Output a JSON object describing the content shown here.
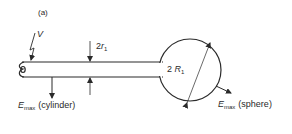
{
  "figure": {
    "panel_label": "(a)",
    "voltage_label": "V",
    "wire_diameter_label": {
      "prefix": "2",
      "var": "r",
      "sub": "1"
    },
    "sphere_diameter_label": {
      "prefix": "2 ",
      "var": "R",
      "sub": "1"
    },
    "emax_cylinder": {
      "var": "E",
      "sub": "max",
      "desc": "(cylinder)"
    },
    "emax_sphere": {
      "var": "E",
      "sub": "max",
      "desc": "(sphere)"
    },
    "colors": {
      "stroke": "#2a2a2a",
      "background": "#ffffff"
    }
  }
}
